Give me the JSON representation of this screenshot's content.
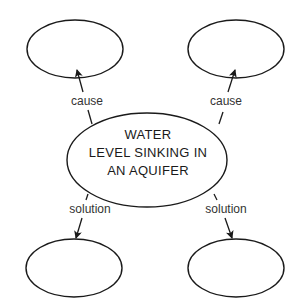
{
  "diagram": {
    "center_node": {
      "lines": [
        "WATER",
        "LEVEL SINKING IN",
        "AN AQUIFER"
      ]
    },
    "nodes": [
      {
        "id": "cause-left",
        "text": ""
      },
      {
        "id": "cause-right",
        "text": ""
      },
      {
        "id": "solution-left",
        "text": ""
      },
      {
        "id": "solution-right",
        "text": ""
      }
    ],
    "edges": [
      {
        "from": "center",
        "to": "cause-left",
        "label": "cause"
      },
      {
        "from": "center",
        "to": "cause-right",
        "label": "cause"
      },
      {
        "from": "center",
        "to": "solution-left",
        "label": "solution"
      },
      {
        "from": "center",
        "to": "solution-right",
        "label": "solution"
      }
    ],
    "colors": {
      "stroke": "#1a1a1a",
      "label": "#333333",
      "background": "#ffffff"
    }
  }
}
